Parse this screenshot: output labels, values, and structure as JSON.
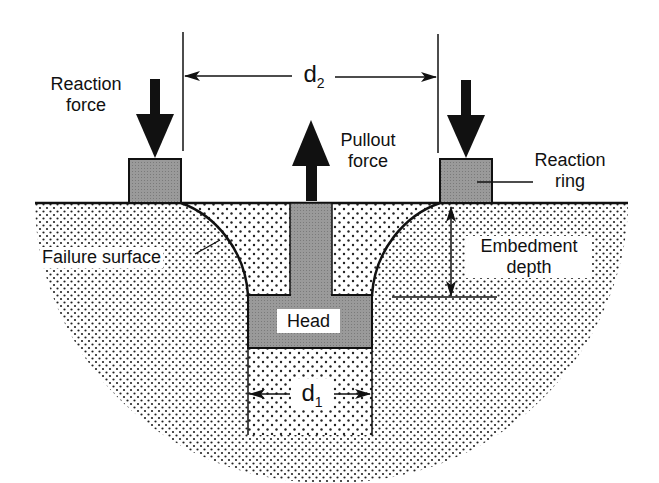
{
  "labels": {
    "reaction_force": [
      "Reaction",
      "force"
    ],
    "pullout_force": [
      "Pullout",
      "force"
    ],
    "reaction_ring": [
      "Reaction",
      "ring"
    ],
    "failure_surface": "Failure surface",
    "embedment_depth": [
      "Embedment",
      "depth"
    ],
    "head": "Head",
    "d2": {
      "base": "d",
      "sub": "2"
    },
    "d1": {
      "base": "d",
      "sub": "1"
    }
  },
  "colors": {
    "ink": "#111111",
    "ring_fill": "#8e8e8e",
    "insert_fill": "#8e8e8e",
    "soil_dots": "#222222",
    "background": "#ffffff"
  }
}
